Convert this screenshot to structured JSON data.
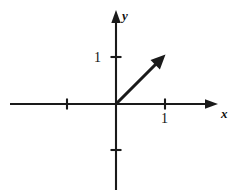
{
  "figure": {
    "kind": "vector-in-coordinate-plane",
    "background_color": "#ffffff",
    "ink_color": "#1a1a1a",
    "axes": {
      "x_axis": {
        "label": "x",
        "tick_labels": [
          "1"
        ],
        "ticks_at": [
          -1,
          1
        ],
        "has_arrow_head": true,
        "arrow_direction": "right"
      },
      "y_axis": {
        "label": "y",
        "tick_labels": [
          "1"
        ],
        "ticks_at": [
          -1,
          1
        ],
        "has_arrow_head": true,
        "arrow_direction": "up"
      },
      "unit_spacing_px": 48,
      "origin_px": {
        "x": 116,
        "y": 104
      }
    },
    "vector": {
      "tail": {
        "x": 0,
        "y": 0
      },
      "head": {
        "x": 1,
        "y": 1
      },
      "tail_px": {
        "x": 116,
        "y": 104
      },
      "head_px": {
        "x": 164,
        "y": 56
      },
      "has_arrow_head": true,
      "color": "#1a1a1a"
    }
  }
}
